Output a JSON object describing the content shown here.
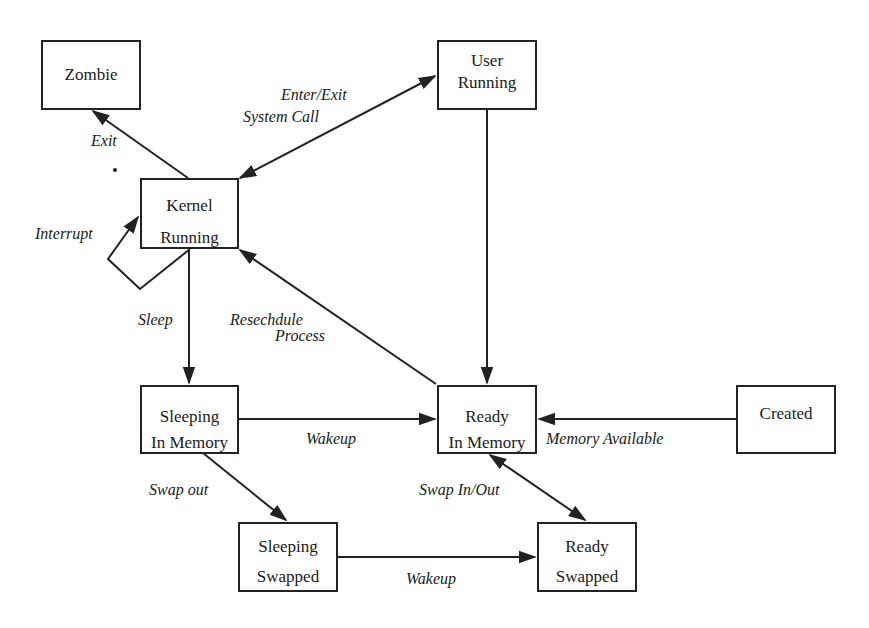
{
  "diagram": {
    "type": "state-transition",
    "states": [
      {
        "id": "zombie",
        "lines": [
          "Zombie"
        ]
      },
      {
        "id": "user_running",
        "lines": [
          "User",
          "Running"
        ]
      },
      {
        "id": "kernel_running",
        "lines": [
          "Kernel",
          "Running"
        ]
      },
      {
        "id": "sleeping_in_memory",
        "lines": [
          "Sleeping",
          "In Memory"
        ]
      },
      {
        "id": "ready_in_memory",
        "lines": [
          "Ready",
          "In Memory"
        ]
      },
      {
        "id": "created",
        "lines": [
          "Created"
        ]
      },
      {
        "id": "sleeping_swapped",
        "lines": [
          "Sleeping",
          "Swapped"
        ]
      },
      {
        "id": "ready_swapped",
        "lines": [
          "Ready",
          "Swapped"
        ]
      }
    ],
    "transitions": [
      {
        "from": "kernel_running",
        "to": "zombie",
        "label": "Exit"
      },
      {
        "from": "kernel_running",
        "to": "user_running",
        "label": "Enter/Exit System Call",
        "bidirectional": true
      },
      {
        "from": "kernel_running",
        "to": "kernel_running",
        "label": "Interrupt"
      },
      {
        "from": "kernel_running",
        "to": "sleeping_in_memory",
        "label": "Sleep"
      },
      {
        "from": "ready_in_memory",
        "to": "kernel_running",
        "label": "Resechdule Process"
      },
      {
        "from": "user_running",
        "to": "ready_in_memory",
        "label": ""
      },
      {
        "from": "sleeping_in_memory",
        "to": "ready_in_memory",
        "label": "Wakeup"
      },
      {
        "from": "created",
        "to": "ready_in_memory",
        "label": "Memory Available"
      },
      {
        "from": "sleeping_in_memory",
        "to": "sleeping_swapped",
        "label": "Swap out"
      },
      {
        "from": "ready_in_memory",
        "to": "ready_swapped",
        "label": "Swap In/Out",
        "bidirectional": true
      },
      {
        "from": "sleeping_swapped",
        "to": "ready_swapped",
        "label": "Wakeup"
      }
    ]
  },
  "labels": {
    "exit": "Exit",
    "enter_exit": "Enter/Exit",
    "system_call": "System Call",
    "interrupt": "Interrupt",
    "sleep": "Sleep",
    "reschedule": "Resechdule",
    "process": "Process",
    "wakeup_memory": "Wakeup",
    "memory_available": "Memory Available",
    "swap_out": "Swap out",
    "swap_in_out": "Swap In/Out",
    "wakeup_swapped": "Wakeup"
  }
}
